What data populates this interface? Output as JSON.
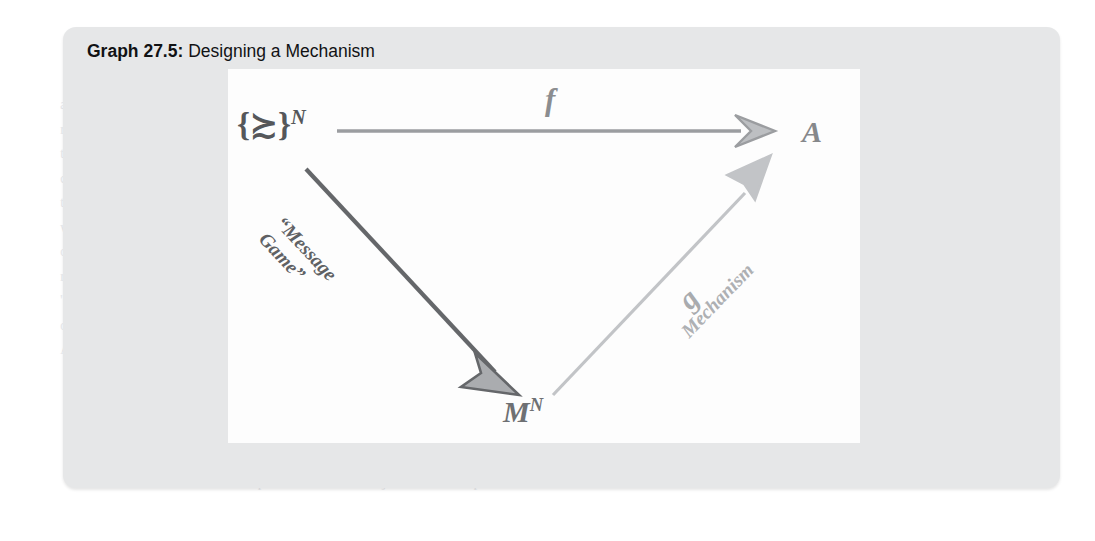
{
  "figure": {
    "label": "Graph 27.5:",
    "caption": "Designing a Mechanism",
    "title_full": "Graph 27.5: Designing a Mechanism"
  },
  "diagram": {
    "type": "commutative-triangle",
    "nodes": [
      {
        "id": "sources",
        "label": "{≿}",
        "superscript": "N",
        "display": "{≿}^N",
        "meaning": "set of preference profiles",
        "position": "top-left",
        "color": "#55575a"
      },
      {
        "id": "alternatives",
        "label": "A",
        "superscript": "",
        "display": "A",
        "meaning": "set of alternatives / outcomes",
        "position": "top-right",
        "color": "#86888b"
      },
      {
        "id": "messages",
        "label": "M",
        "superscript": "N",
        "display": "M^N",
        "meaning": "message space profiles",
        "position": "bottom-center",
        "color": "#6e7073"
      }
    ],
    "edges": [
      {
        "id": "f",
        "from": "sources",
        "to": "alternatives",
        "label": "f",
        "sublabel": "",
        "direction": "horizontal-right",
        "color": "#9b9da0",
        "arrowhead": "open-chevron"
      },
      {
        "id": "message-game",
        "from": "sources",
        "to": "messages",
        "label": "",
        "sublabel_line1": "“Message",
        "sublabel_line2": "Game”",
        "direction": "diagonal-down-right",
        "color": "#65676a",
        "arrowhead": "filled-triangle"
      },
      {
        "id": "g",
        "from": "messages",
        "to": "alternatives",
        "label": "g",
        "sublabel": "Mechanism",
        "direction": "diagonal-up-right",
        "color": "#c2c4c7",
        "arrowhead": "filled-triangle"
      }
    ]
  },
  "colors": {
    "card_background": "#e6e7e8",
    "panel_background": "#fdfdfd",
    "title_text": "#111214",
    "arrow_dark": "#65676a",
    "arrow_mid": "#9b9da0",
    "arrow_light": "#c2c4c7",
    "bleed_text": "#e9eaec"
  },
  "background_bleed": {
    "left_column": [
      "a process of Graph",
      "revealed a",
      "the same",
      "concept for",
      "the outcome",
      "we find out",
      "of us is the",
      "remainder",
      "'s. The true",
      "of elements",
      "A truly"
    ],
    "right_column": [
      "must that we pla",
      "in step (1) b",
      "deception of the",
      "be achieved a",
      "the consumer",
      "used by man co",
      "d one in a whi",
      "ction between",
      "the fixed and th",
      "gh enough p",
      "ach will not be"
    ],
    "bottom_line": "which implies that consumer j would face a price that is less than"
  }
}
